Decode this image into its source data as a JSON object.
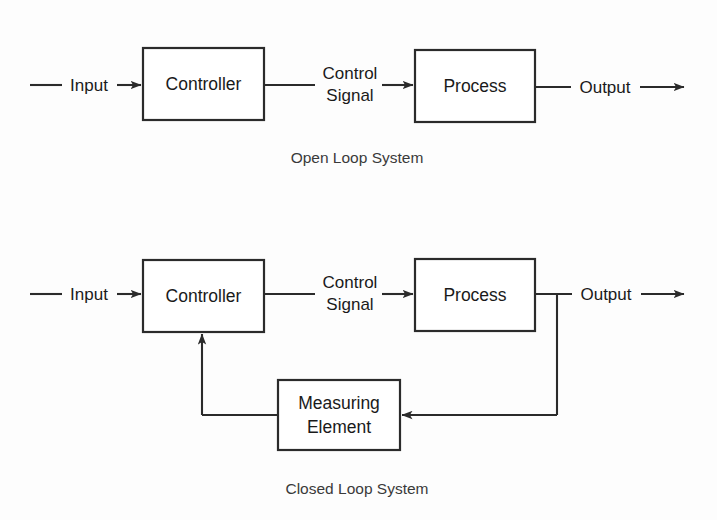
{
  "document": {
    "title": "Control System Block Diagrams",
    "background_color": "#fdfdfd",
    "line_color": "#2b2b2b",
    "text_color": "#1a1a1a"
  },
  "diagrams": [
    {
      "id": "open-loop",
      "caption": "Open Loop System",
      "blocks": [
        {
          "id": "controller",
          "label": "Controller"
        },
        {
          "id": "process",
          "label": "Process"
        }
      ],
      "signals": [
        {
          "id": "input",
          "label": "Input"
        },
        {
          "id": "control-signal",
          "label_line1": "Control",
          "label_line2": "Signal"
        },
        {
          "id": "output",
          "label": "Output"
        }
      ]
    },
    {
      "id": "closed-loop",
      "caption": "Closed Loop System",
      "blocks": [
        {
          "id": "controller",
          "label": "Controller"
        },
        {
          "id": "process",
          "label": "Process"
        },
        {
          "id": "measuring-element",
          "label_line1": "Measuring",
          "label_line2": "Element"
        }
      ],
      "signals": [
        {
          "id": "input",
          "label": "Input"
        },
        {
          "id": "control-signal",
          "label_line1": "Control",
          "label_line2": "Signal"
        },
        {
          "id": "output",
          "label": "Output"
        },
        {
          "id": "feedback",
          "label": ""
        }
      ]
    }
  ]
}
